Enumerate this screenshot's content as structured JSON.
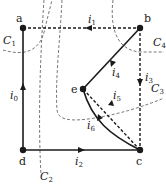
{
  "diagram": {
    "type": "graph-with-cutsets",
    "colors": {
      "ink": "#1a1a1a",
      "cut": "#555555",
      "background": "#ffffff"
    },
    "nodes": [
      {
        "id": "a",
        "label": "a"
      },
      {
        "id": "b",
        "label": "b"
      },
      {
        "id": "c",
        "label": "c"
      },
      {
        "id": "d",
        "label": "d"
      },
      {
        "id": "e",
        "label": "e"
      }
    ],
    "edges": [
      {
        "id": "i0",
        "label": "i",
        "sub": "0",
        "from": "d",
        "to": "a",
        "style": "solid"
      },
      {
        "id": "i1",
        "label": "i",
        "sub": "1",
        "from": "b",
        "to": "a",
        "style": "dashed"
      },
      {
        "id": "i2",
        "label": "i",
        "sub": "2",
        "from": "d",
        "to": "c",
        "style": "solid"
      },
      {
        "id": "i3",
        "label": "i",
        "sub": "3",
        "from": "b",
        "to": "c",
        "style": "dashed"
      },
      {
        "id": "i4",
        "label": "i",
        "sub": "4",
        "from": "b",
        "to": "e",
        "style": "solid"
      },
      {
        "id": "i5",
        "label": "i",
        "sub": "5",
        "from": "c",
        "to": "e",
        "style": "dashed"
      },
      {
        "id": "i6",
        "label": "i",
        "sub": "6",
        "from": "c",
        "to": "e",
        "style": "solid-curved"
      }
    ],
    "cutsets": [
      {
        "id": "C1",
        "label": "C",
        "sub": "1"
      },
      {
        "id": "C2",
        "label": "C",
        "sub": "2"
      },
      {
        "id": "C3",
        "label": "C",
        "sub": "3"
      },
      {
        "id": "C4",
        "label": "C",
        "sub": "4"
      }
    ]
  }
}
